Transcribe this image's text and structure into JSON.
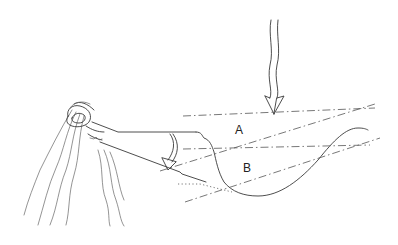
{
  "diagram": {
    "labels": {
      "region_a": "A",
      "region_b": "B"
    },
    "elements": [
      "observer-eye",
      "rising-heat-lines",
      "viewing-cone",
      "curved-rotation-arrow",
      "incoming-wavy-arrow",
      "terrain-profile-curve",
      "dash-dot-reference-lines",
      "dotted-sightline"
    ],
    "colors": {
      "ink": "#3a3a3a",
      "background": "#ffffff"
    }
  }
}
